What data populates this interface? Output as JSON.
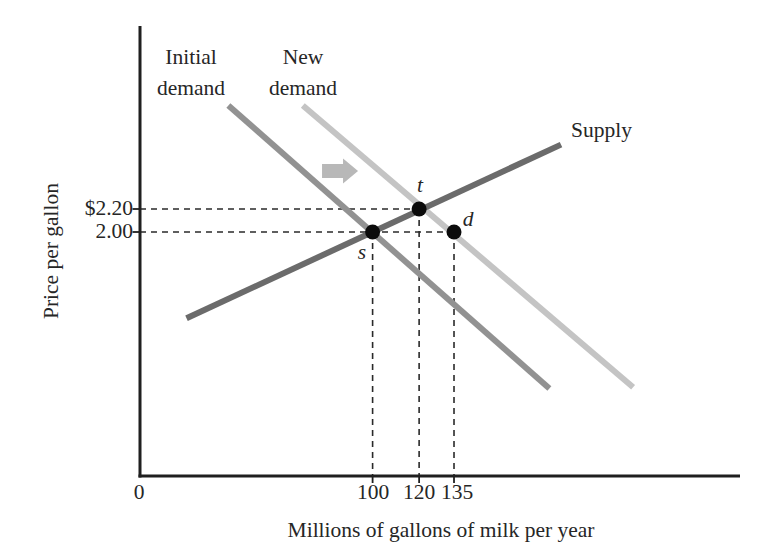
{
  "chart_data": {
    "type": "line",
    "xlabel": "Millions of gallons of milk per year",
    "ylabel": "Price per gallon",
    "x_axis": {
      "origin_label": "0",
      "ticks": [
        100,
        120,
        135
      ]
    },
    "y_axis": {
      "ticks": [
        {
          "label": "$2.20",
          "value": 2.2
        },
        {
          "label": "2.00",
          "value": 2.0
        }
      ]
    },
    "series": [
      {
        "id": "initial-demand",
        "name": "Initial demand",
        "label_lines": [
          "Initial",
          "demand"
        ],
        "color": "#929292",
        "points": [
          [
            38,
            3.1
          ],
          [
            176,
            0.64
          ]
        ]
      },
      {
        "id": "new-demand",
        "name": "New demand",
        "label_lines": [
          "New",
          "demand"
        ],
        "color": "#c4c4c4",
        "points": [
          [
            70,
            3.1
          ],
          [
            212,
            0.65
          ]
        ]
      },
      {
        "id": "supply",
        "name": "Supply",
        "label_lines": [
          "Supply"
        ],
        "color": "#6b6b6b",
        "points": [
          [
            20,
            1.25
          ],
          [
            181,
            2.76
          ]
        ]
      }
    ],
    "points": [
      {
        "id": "s",
        "label": "s",
        "q": 100,
        "p": 2.0
      },
      {
        "id": "t",
        "label": "t",
        "q": 120,
        "p": 2.2
      },
      {
        "id": "d",
        "label": "d",
        "q": 135,
        "p": 2.0
      }
    ],
    "guides": {
      "horizontal": [
        {
          "p": 2.2,
          "to_q": 120
        },
        {
          "p": 2.0,
          "to_q": 135
        }
      ],
      "vertical": [
        {
          "q": 100,
          "from_p": 2.0
        },
        {
          "q": 120,
          "from_p": 2.2
        },
        {
          "q": 135,
          "from_p": 2.0
        }
      ]
    },
    "shift_arrow": {
      "direction": "right",
      "q": 86,
      "p": 2.53
    }
  },
  "colors": {
    "background": "#ffffff",
    "axis": "#1f1f1f",
    "text": "#262626",
    "guide": "#2a2a2a",
    "point": "#0b0b0b",
    "supply_line": "#6b6b6b",
    "initial_demand_line": "#929292",
    "new_demand_line": "#c4c4c4",
    "shift_arrow": "#b8b8b8"
  }
}
